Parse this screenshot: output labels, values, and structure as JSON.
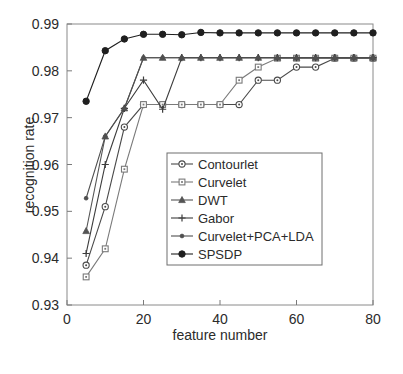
{
  "chart_data": {
    "type": "line",
    "title": "",
    "xlabel": "feature number",
    "ylabel": "recognition rate",
    "xlim": [
      0,
      80
    ],
    "ylim": [
      0.93,
      0.99
    ],
    "xticks": [
      0,
      20,
      40,
      60,
      80
    ],
    "xtick_labels": [
      "0",
      "20",
      "40",
      "60",
      "80"
    ],
    "yticks": [
      0.93,
      0.94,
      0.95,
      0.96,
      0.97,
      0.98,
      0.99
    ],
    "ytick_labels": [
      "0.93",
      "0.94",
      "0.95",
      "0.96",
      "0.97",
      "0.98",
      "0.99"
    ],
    "grid": false,
    "legend_position": "center",
    "x": [
      5,
      10,
      15,
      20,
      25,
      30,
      35,
      40,
      45,
      50,
      55,
      60,
      65,
      70,
      75,
      80
    ],
    "series": [
      {
        "name": "Contourlet",
        "marker": "circle-open",
        "color": "#4a4a4a",
        "values": [
          0.9385,
          0.951,
          0.968,
          0.9728,
          0.9728,
          0.9728,
          0.9728,
          0.9728,
          0.9728,
          0.978,
          0.978,
          0.9808,
          0.9808,
          0.9827,
          0.9827,
          0.9827
        ]
      },
      {
        "name": "Curvelet",
        "marker": "square-open",
        "color": "#7a7a7a",
        "values": [
          0.936,
          0.942,
          0.959,
          0.9728,
          0.9728,
          0.9728,
          0.9728,
          0.9728,
          0.978,
          0.9808,
          0.9827,
          0.9827,
          0.9827,
          0.9827,
          0.9827,
          0.9827
        ]
      },
      {
        "name": "DWT",
        "marker": "triangle-filled",
        "color": "#545454",
        "values": [
          0.9458,
          0.966,
          0.972,
          0.9828,
          0.9828,
          0.9828,
          0.9828,
          0.9828,
          0.9828,
          0.9828,
          0.9828,
          0.9828,
          0.9828,
          0.9828,
          0.9828,
          0.9828
        ]
      },
      {
        "name": "Gabor",
        "marker": "plus",
        "color": "#3d3d3d",
        "values": [
          0.941,
          0.96,
          0.972,
          0.978,
          0.9718,
          0.9828,
          0.9828,
          0.9828,
          0.9828,
          0.9828,
          0.9828,
          0.9828,
          0.9828,
          0.9828,
          0.9828,
          0.9828
        ]
      },
      {
        "name": "Curvelet+PCA+LDA",
        "marker": "dot-filled",
        "color": "#4f4f4f",
        "values": [
          0.9528,
          0.966,
          0.972,
          0.9828,
          0.9828,
          0.9828,
          0.9828,
          0.9828,
          0.9828,
          0.9828,
          0.9828,
          0.9828,
          0.9828,
          0.9828,
          0.9828,
          0.9828
        ]
      },
      {
        "name": "SPSDP",
        "marker": "circle-filled",
        "color": "#1f1f1f",
        "values": [
          0.9735,
          0.9843,
          0.9868,
          0.9878,
          0.9878,
          0.9877,
          0.9882,
          0.9881,
          0.9881,
          0.9881,
          0.9881,
          0.9881,
          0.9881,
          0.9881,
          0.9881,
          0.9881
        ]
      }
    ]
  },
  "legend": {
    "entries": [
      {
        "label": "Contourlet"
      },
      {
        "label": "Curvelet"
      },
      {
        "label": "DWT"
      },
      {
        "label": "Gabor"
      },
      {
        "label": "Curvelet+PCA+LDA"
      },
      {
        "label": "SPSDP"
      }
    ]
  }
}
